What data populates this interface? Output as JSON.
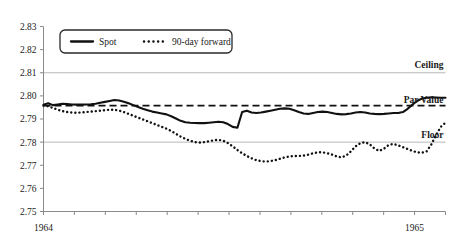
{
  "chart_data": {
    "type": "line",
    "title": "",
    "xlabel": "",
    "ylabel": "",
    "ylim": [
      2.75,
      2.83
    ],
    "ytick_labels": [
      "2.83",
      "2.82",
      "2.81",
      "2.80",
      "2.79",
      "2.78",
      "2.77",
      "2.76",
      "2.75"
    ],
    "ytick_values": [
      2.83,
      2.82,
      2.81,
      2.8,
      2.79,
      2.78,
      2.77,
      2.76,
      2.75
    ],
    "xtick_labels": [
      "1964",
      "1965"
    ],
    "xtick_positions": [
      0,
      12
    ],
    "x_major_ticks": 14,
    "grid": "horizontal gridlines at 2.81 and 2.78 only",
    "legend_position": "top-left inside plot",
    "annotations": [
      {
        "label": "Ceiling",
        "value": 2.8105,
        "style": "solid-gridline"
      },
      {
        "label": "Par Value",
        "value": 2.7958,
        "style": "dashed"
      },
      {
        "label": "Floor",
        "value": 2.78,
        "style": "solid-gridline"
      }
    ],
    "series": [
      {
        "name": "Spot",
        "style": "solid",
        "color": "#111111",
        "values": [
          2.7962,
          2.7968,
          2.796,
          2.7963,
          2.7966,
          2.7965,
          2.7963,
          2.7962,
          2.7962,
          2.7963,
          2.7964,
          2.7966,
          2.797,
          2.7974,
          2.7978,
          2.7982,
          2.798,
          2.7975,
          2.7968,
          2.796,
          2.7952,
          2.7944,
          2.7938,
          2.7932,
          2.7928,
          2.7924,
          2.792,
          2.7912,
          2.7902,
          2.7892,
          2.7886,
          2.7884,
          2.7883,
          2.7882,
          2.7882,
          2.7884,
          2.7886,
          2.7888,
          2.7886,
          2.7878,
          2.7866,
          2.7862,
          2.793,
          2.7936,
          2.7928,
          2.7926,
          2.7928,
          2.7932,
          2.7936,
          2.794,
          2.7944,
          2.7946,
          2.7944,
          2.7938,
          2.793,
          2.7924,
          2.7922,
          2.7926,
          2.793,
          2.7932,
          2.793,
          2.7926,
          2.7922,
          2.792,
          2.7921,
          2.7924,
          2.7928,
          2.793,
          2.7928,
          2.7924,
          2.7922,
          2.7921,
          2.7922,
          2.7924,
          2.7926,
          2.7926,
          2.793,
          2.7944,
          2.7962,
          2.7978,
          2.7988,
          2.7992,
          2.7994,
          2.7993,
          2.7992,
          2.7992
        ]
      },
      {
        "name": "90-day forward",
        "style": "dotted",
        "color": "#111111",
        "values": [
          2.7958,
          2.7955,
          2.7948,
          2.794,
          2.7934,
          2.793,
          2.7928,
          2.7927,
          2.7928,
          2.793,
          2.7932,
          2.7934,
          2.7936,
          2.7938,
          2.794,
          2.794,
          2.7936,
          2.793,
          2.7922,
          2.7914,
          2.7906,
          2.7898,
          2.789,
          2.7882,
          2.7874,
          2.7866,
          2.7858,
          2.7848,
          2.7836,
          2.7824,
          2.7814,
          2.7806,
          2.78,
          2.7798,
          2.78,
          2.7804,
          2.7808,
          2.781,
          2.7806,
          2.7796,
          2.7782,
          2.7766,
          2.7752,
          2.774,
          2.773,
          2.7722,
          2.7718,
          2.7716,
          2.7718,
          2.7722,
          2.7728,
          2.7734,
          2.7738,
          2.774,
          2.774,
          2.7742,
          2.7746,
          2.7752,
          2.7756,
          2.7756,
          2.7752,
          2.7746,
          2.7738,
          2.7734,
          2.7742,
          2.776,
          2.7782,
          2.7796,
          2.78,
          2.779,
          2.7772,
          2.7762,
          2.7772,
          2.7788,
          2.7792,
          2.7786,
          2.7778,
          2.777,
          2.7762,
          2.7756,
          2.7754,
          2.776,
          2.779,
          2.783,
          2.7866,
          2.7884
        ]
      }
    ]
  },
  "legend": {
    "items": [
      {
        "label": "Spot",
        "style": "solid"
      },
      {
        "label": "90-day forward",
        "style": "dotted"
      }
    ]
  },
  "axes": {
    "y_labels": [
      "2.83",
      "2.82",
      "2.81",
      "2.80",
      "2.79",
      "2.78",
      "2.77",
      "2.76",
      "2.75"
    ],
    "x_labels": [
      "1964",
      "1965"
    ]
  },
  "bands": {
    "ceiling_label": "Ceiling",
    "par_value_label": "Par Value",
    "floor_label": "Floor"
  },
  "colors": {
    "line": "#111111",
    "grid": "#b8b8b8",
    "axis": "#8a8a8a",
    "text": "#1a1a1a"
  }
}
